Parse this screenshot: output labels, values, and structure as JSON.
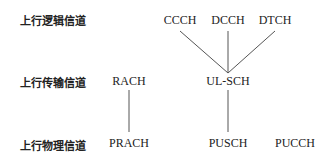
{
  "diagram": {
    "rows": [
      {
        "label": "上行逻辑信道"
      },
      {
        "label": "上行传输信道"
      },
      {
        "label": "上行物理信道"
      }
    ],
    "nodes": {
      "ccch": "CCCH",
      "dcch": "DCCH",
      "dtch": "DTCH",
      "rach": "RACH",
      "ulsch": "UL-SCH",
      "prach": "PRACH",
      "pusch": "PUSCH",
      "pucch": "PUCCH"
    },
    "edges": [
      [
        "CCCH",
        "UL-SCH"
      ],
      [
        "DCCH",
        "UL-SCH"
      ],
      [
        "DTCH",
        "UL-SCH"
      ],
      [
        "RACH",
        "PRACH"
      ],
      [
        "UL-SCH",
        "PUSCH"
      ]
    ],
    "line_color": "#555555"
  }
}
